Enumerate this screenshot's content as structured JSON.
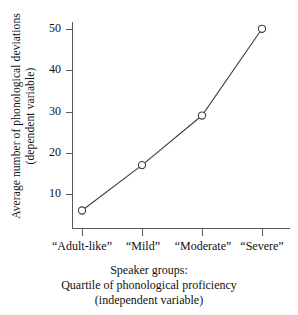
{
  "chart_data": {
    "type": "line",
    "title": "",
    "subtitle": "",
    "categories": [
      "“Adult-like”",
      "“Mild”",
      "“Moderate”",
      "“Severe”"
    ],
    "values": [
      6,
      17,
      29,
      50
    ],
    "series": [
      {
        "name": "Average number of phonological deviations",
        "values": [
          6,
          17,
          29,
          50
        ]
      }
    ],
    "xlabel": "Speaker groups: Quartile of phonological proficiency (independent variable)",
    "ylabel": "Average number of phonological deviations (dependent variable)",
    "ylim": [
      0,
      53
    ],
    "yticks": [
      10,
      20,
      30,
      40,
      50
    ],
    "ytick_labels": [
      "10",
      "20",
      "30",
      "40",
      "50"
    ],
    "grid": false,
    "legend": false,
    "legend_position": "none",
    "marker": "open-circle",
    "line_color": "#3d3d3d",
    "marker_color": "#3d3d3d",
    "axis_color": "#5a5a5a",
    "background_color": "#ffffff",
    "annotations": []
  },
  "axes": {
    "y_title_line1": "Average number of phonological deviations",
    "y_title_line2": "(dependent variable)",
    "y_ticks": [
      {
        "label": "50",
        "value": 50
      },
      {
        "label": "40",
        "value": 40
      },
      {
        "label": "30",
        "value": 30
      },
      {
        "label": "20",
        "value": 20
      },
      {
        "label": "10",
        "value": 10
      }
    ],
    "x_ticks": [
      {
        "label": "“Adult-like”",
        "value": 6
      },
      {
        "label": "“Mild”",
        "value": 17
      },
      {
        "label": "“Moderate”",
        "value": 29
      },
      {
        "label": "“Severe”",
        "value": 50
      }
    ]
  },
  "caption": {
    "line1": "Speaker groups:",
    "line2": "Quartile of phonological proficiency",
    "line3": "(independent variable)"
  }
}
